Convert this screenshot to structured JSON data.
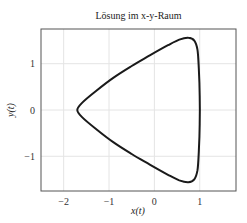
{
  "chart_data": {
    "type": "line",
    "title": "Lösung im x-y-Raum",
    "xlabel": "x(t)",
    "ylabel": "y(t)",
    "xlim": [
      -2.5,
      1.8
    ],
    "ylim": [
      -1.75,
      1.75
    ],
    "xticks": [
      -2,
      -1,
      0,
      1
    ],
    "yticks": [
      -1,
      0,
      1
    ],
    "xtick_labels": [
      "−2",
      "−1",
      "0",
      "1"
    ],
    "ytick_labels": [
      "−1",
      "0",
      "1"
    ],
    "grid": true,
    "legend": null,
    "series": [
      {
        "name": "trajectory",
        "color": "#1a1a1a",
        "closed": true,
        "x": [
          -1.7,
          -1.6,
          -1.3,
          -0.9,
          -0.5,
          -0.1,
          0.3,
          0.55,
          0.75,
          0.88,
          0.95,
          0.98,
          1.0,
          1.0,
          0.98,
          0.95,
          0.88,
          0.75,
          0.55,
          0.3,
          -0.1,
          -0.5,
          -0.9,
          -1.3,
          -1.6,
          -1.7
        ],
        "y": [
          0.0,
          0.15,
          0.4,
          0.7,
          0.95,
          1.18,
          1.4,
          1.52,
          1.56,
          1.5,
          1.3,
          0.9,
          0.3,
          -0.3,
          -0.9,
          -1.3,
          -1.5,
          -1.56,
          -1.52,
          -1.4,
          -1.18,
          -0.95,
          -0.7,
          -0.4,
          -0.15,
          0.0
        ]
      }
    ]
  },
  "labels": {
    "title": "Lösung im x-y-Raum",
    "xlabel": "x(t)",
    "ylabel": "y(t)"
  }
}
